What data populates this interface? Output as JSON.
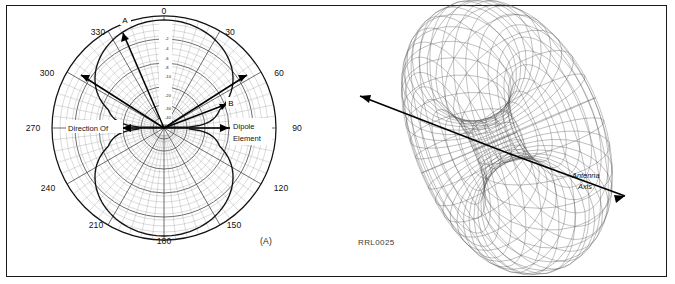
{
  "figure": {
    "id_code": "RRL0025",
    "panel_a_tag": "(A)",
    "panel_b_tag": "(B)"
  },
  "panel_a": {
    "title": "Dipole azimuth radiation pattern (polar plot)",
    "angle_labels": [
      "0",
      "30",
      "60",
      "90",
      "120",
      "150",
      "180",
      "210",
      "240",
      "270",
      "300",
      "330"
    ],
    "db_labels": [
      "-2",
      "-4",
      "-6",
      "-8",
      "-10",
      "-20",
      "-30",
      "-40"
    ],
    "markers": [
      "A",
      "B"
    ],
    "annotation_left": "Direction Of",
    "annotation_right_line1": "Dipole",
    "annotation_right_line2": "Element"
  },
  "panel_b": {
    "title": "Three dimensional doughnut radiation pattern",
    "axis_label_line1": "Antenna",
    "axis_label_line2": "Axis"
  },
  "chart_data": {
    "type": "line",
    "subcharts": [
      {
        "type": "polar",
        "name": "Azimuth pattern (A)",
        "angle_unit": "degrees",
        "angle_ticks": [
          0,
          30,
          60,
          90,
          120,
          150,
          180,
          210,
          240,
          270,
          300,
          330
        ],
        "radial_unit": "dB",
        "radial_ticks": [
          -2,
          -4,
          -6,
          -8,
          -10,
          -20,
          -30,
          -40
        ],
        "radial_range": [
          -40,
          0
        ],
        "grid": true,
        "pattern_description": "figure-eight two-lobe dipole pattern with maxima at 0 and 180 degrees and nulls at 90 and 270 degrees",
        "pattern_points_deg_db": [
          {
            "angle": 0,
            "db": 0
          },
          {
            "angle": 15,
            "db": -0.3
          },
          {
            "angle": 30,
            "db": -1.2
          },
          {
            "angle": 45,
            "db": -3.0
          },
          {
            "angle": 60,
            "db": -6.0
          },
          {
            "angle": 75,
            "db": -11.7
          },
          {
            "angle": 90,
            "db": -40
          },
          {
            "angle": 105,
            "db": -11.7
          },
          {
            "angle": 120,
            "db": -6.0
          },
          {
            "angle": 135,
            "db": -3.0
          },
          {
            "angle": 150,
            "db": -1.2
          },
          {
            "angle": 165,
            "db": -0.3
          },
          {
            "angle": 180,
            "db": 0
          },
          {
            "angle": 195,
            "db": -0.3
          },
          {
            "angle": 210,
            "db": -1.2
          },
          {
            "angle": 225,
            "db": -3.0
          },
          {
            "angle": 240,
            "db": -6.0
          },
          {
            "angle": 255,
            "db": -11.7
          },
          {
            "angle": 270,
            "db": -40
          },
          {
            "angle": 285,
            "db": -11.7
          },
          {
            "angle": 300,
            "db": -6.0
          },
          {
            "angle": 315,
            "db": -3.0
          },
          {
            "angle": 330,
            "db": -1.2
          },
          {
            "angle": 345,
            "db": -0.3
          }
        ],
        "annotations": [
          {
            "label": "A",
            "angle": 337,
            "note": "beam direction marker upper left"
          },
          {
            "label": "B",
            "angle": 48,
            "note": "beam direction marker right"
          },
          {
            "label": "Direction Of",
            "angle": 270,
            "note": "left horizontal arrow"
          },
          {
            "label": "Dipole Element",
            "angle": 90,
            "note": "right horizontal arrow"
          }
        ]
      },
      {
        "type": "surface",
        "name": "Three dimensional pattern (B)",
        "shape": "torus",
        "annotations": [
          {
            "label": "Antenna Axis",
            "note": "arrow through torus hole, lower right"
          },
          {
            "label": "",
            "note": "arrow exiting upper left"
          }
        ]
      }
    ]
  }
}
